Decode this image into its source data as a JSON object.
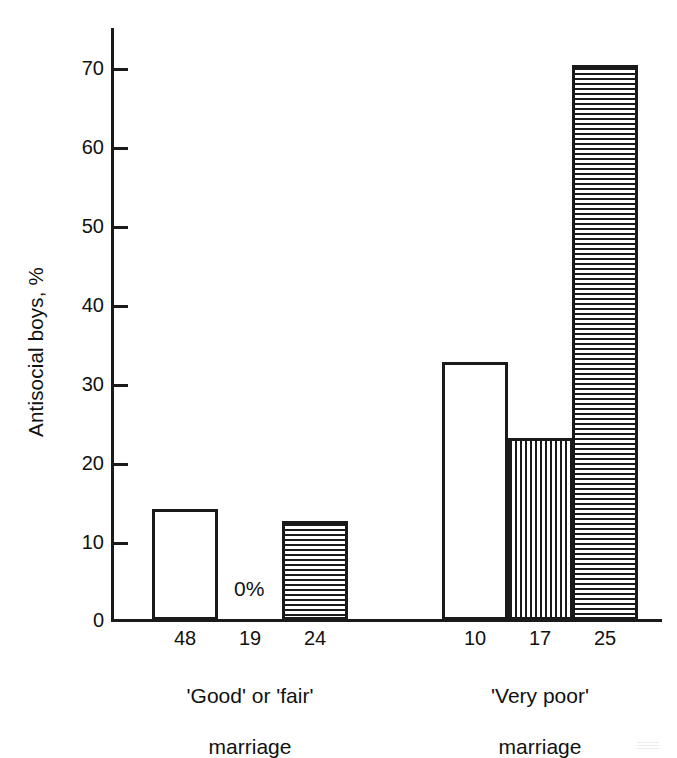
{
  "chart_data": {
    "type": "bar",
    "title": "",
    "xlabel": "",
    "ylabel": "Antisocial boys, %",
    "ylim": [
      0,
      75
    ],
    "yticks": [
      0,
      10,
      20,
      30,
      40,
      50,
      60,
      70
    ],
    "ytick_labels": [
      "0",
      "10",
      "20",
      "30",
      "40",
      "50",
      "60",
      "70"
    ],
    "grid": false,
    "legend": "none",
    "categories": [
      "48",
      "19",
      "24",
      "10",
      "17",
      "25"
    ],
    "values": [
      14,
      0,
      12.5,
      32.5,
      23,
      70
    ],
    "bars": [
      {
        "n_label": "48",
        "value": 14,
        "fill": "plain",
        "group": "'Good' or 'fair' marriage",
        "value_label": ""
      },
      {
        "n_label": "19",
        "value": 0,
        "fill": "none",
        "group": "'Good' or 'fair' marriage",
        "value_label": "0%"
      },
      {
        "n_label": "24",
        "value": 12.5,
        "fill": "horizontal",
        "group": "'Good' or 'fair' marriage",
        "value_label": ""
      },
      {
        "n_label": "10",
        "value": 32.5,
        "fill": "plain",
        "group": "'Very poor' marriage",
        "value_label": ""
      },
      {
        "n_label": "17",
        "value": 23,
        "fill": "vertical",
        "group": "'Very poor' marriage",
        "value_label": ""
      },
      {
        "n_label": "25",
        "value": 70,
        "fill": "horizontal",
        "group": "'Very poor' marriage",
        "value_label": ""
      }
    ],
    "groups": [
      {
        "line1": "'Good' or 'fair'",
        "line2": "marriage"
      },
      {
        "line1": "'Very poor'",
        "line2": "marriage"
      }
    ],
    "colors": {
      "ink": "#1a1a1a",
      "background": "#ffffff"
    }
  }
}
